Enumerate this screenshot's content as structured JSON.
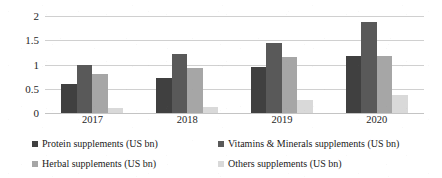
{
  "chart_data": {
    "type": "bar",
    "title": "",
    "subtitle": "",
    "xlabel": "",
    "ylabel": "",
    "categories": [
      "2017",
      "2018",
      "2019",
      "2020"
    ],
    "series": [
      {
        "name": "Protein supplements (US bn)",
        "color": "#404040",
        "values": [
          0.6,
          0.72,
          0.94,
          1.17
        ]
      },
      {
        "name": "Vitamins & Minerals supplements (US bn)",
        "color": "#595959",
        "values": [
          1.0,
          1.22,
          1.45,
          1.88
        ]
      },
      {
        "name": "Herbal supplements (US bn)",
        "color": "#a6a6a6",
        "values": [
          0.81,
          0.93,
          1.15,
          1.17
        ]
      },
      {
        "name": "Others supplements (US bn)",
        "color": "#d9d9d9",
        "values": [
          0.1,
          0.12,
          0.26,
          0.38
        ]
      }
    ],
    "ylim": [
      0,
      2
    ],
    "y_ticks": [
      "0",
      "0.5",
      "1",
      "1.5",
      "2"
    ],
    "y_tick_values": [
      0,
      0.5,
      1,
      1.5,
      2
    ],
    "grid": true,
    "legend_position": "bottom"
  },
  "legend": {
    "entries": [
      {
        "label": "Protein supplements (US bn)",
        "color": "#404040"
      },
      {
        "label": "Vitamins & Minerals supplements (US bn)",
        "color": "#595959"
      },
      {
        "label": "Herbal supplements (US bn)",
        "color": "#a6a6a6"
      },
      {
        "label": "Others supplements (US bn)",
        "color": "#d9d9d9"
      }
    ]
  }
}
